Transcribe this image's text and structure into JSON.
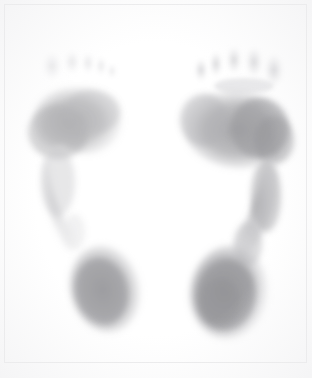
{
  "page": {
    "width": 312,
    "height": 378,
    "background_color": "#ffffff",
    "frame_color": "#e2e2e4",
    "ink_color": "#6f6f72",
    "rendering": "halftone-crosshatch",
    "caption": ""
  },
  "chart_data": {
    "type": "heatmap",
    "subtitle": "",
    "xlabel": "",
    "ylabel": "",
    "grid": false,
    "legend_position": "none",
    "colormap": "grayscale-ink",
    "value_label": "relative plantar contact pressure",
    "scale_min": 0.0,
    "scale_max": 1.0,
    "regions": [
      {
        "name": "left-foot-toes",
        "foot": "left",
        "zone": "toes",
        "intensity": 0.08,
        "bbox": [
          52,
          50,
          70,
          38
        ]
      },
      {
        "name": "left-foot-forefoot",
        "foot": "left",
        "zone": "forefoot",
        "intensity": 0.34,
        "bbox": [
          22,
          88,
          100,
          80
        ]
      },
      {
        "name": "left-foot-lateral-midfoot",
        "foot": "left",
        "zone": "midfoot",
        "intensity": 0.18,
        "bbox": [
          42,
          150,
          50,
          95
        ]
      },
      {
        "name": "left-foot-heel",
        "foot": "left",
        "zone": "heel",
        "intensity": 0.52,
        "bbox": [
          70,
          245,
          70,
          88
        ]
      },
      {
        "name": "right-foot-toes",
        "foot": "right",
        "zone": "toes",
        "intensity": 0.16,
        "bbox": [
          192,
          52,
          98,
          40
        ]
      },
      {
        "name": "right-foot-forefoot",
        "foot": "right",
        "zone": "forefoot",
        "intensity": 0.45,
        "bbox": [
          186,
          92,
          108,
          86
        ]
      },
      {
        "name": "right-foot-lateral-midfoot",
        "foot": "right",
        "zone": "midfoot",
        "intensity": 0.4,
        "bbox": [
          240,
          160,
          50,
          95
        ]
      },
      {
        "name": "right-foot-heel",
        "foot": "right",
        "zone": "heel",
        "intensity": 0.6,
        "bbox": [
          196,
          243,
          82,
          96
        ]
      }
    ],
    "notes": [
      "Two grayscale plantar impressions rendered in a fine crosshatch halftone screen.",
      "Left impression is lighter overall with only faint toe contact and a narrow lateral midfoot strip.",
      "Right impression shows fuller toe contact, a darker lateral forefoot, a continuous lateral midfoot band and the darkest heel."
    ]
  }
}
